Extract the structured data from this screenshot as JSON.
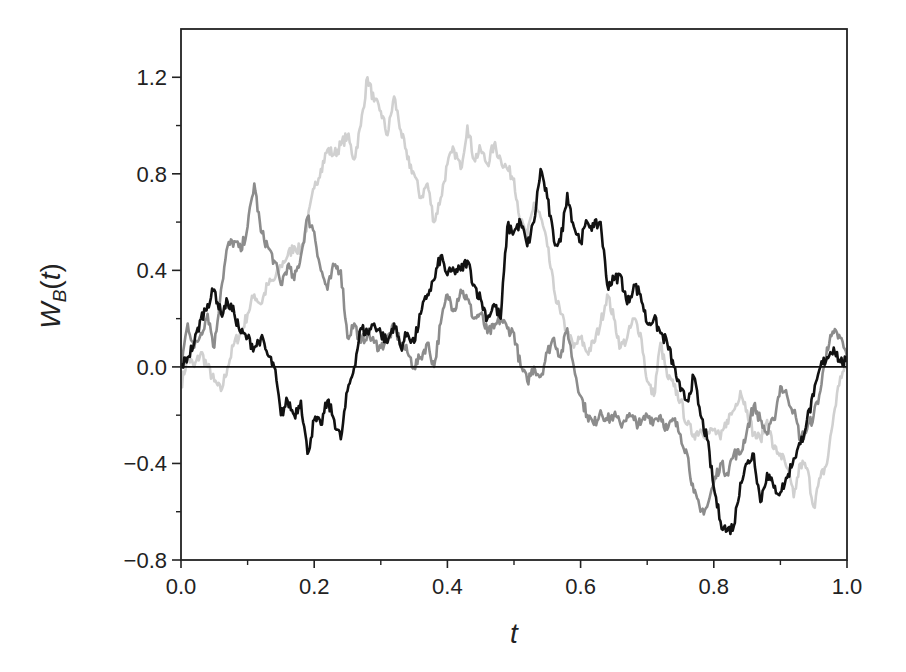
{
  "chart_data": {
    "type": "line",
    "title": "",
    "xlabel": "t",
    "ylabel": "W_B(t)",
    "ylabel_main": "W",
    "ylabel_sub": "B",
    "ylabel_arg": "(t)",
    "xlim": [
      0.0,
      1.0
    ],
    "ylim": [
      -0.8,
      1.4
    ],
    "grid": false,
    "legend": "none",
    "reference_line": {
      "y": 0.0,
      "color": "#111111"
    },
    "x_ticks": [
      "0.0",
      "0.2",
      "0.4",
      "0.6",
      "0.8",
      "1.0"
    ],
    "x_tick_values": [
      0.0,
      0.2,
      0.4,
      0.6,
      0.8,
      1.0
    ],
    "x_minor_ticks": [
      0.1,
      0.3,
      0.5,
      0.7,
      0.9
    ],
    "y_ticks": [
      "1.2",
      "0.8",
      "0.4",
      "0.0",
      "−0.4",
      "−0.8"
    ],
    "y_tick_values": [
      1.2,
      0.8,
      0.4,
      0.0,
      -0.4,
      -0.8
    ],
    "y_minor_ticks": [
      1.0,
      0.6,
      0.2,
      -0.2,
      -0.6
    ],
    "x": [
      0.0,
      0.01,
      0.02,
      0.03,
      0.04,
      0.05,
      0.06,
      0.07,
      0.08,
      0.09,
      0.1,
      0.11,
      0.12,
      0.13,
      0.14,
      0.15,
      0.16,
      0.17,
      0.18,
      0.19,
      0.2,
      0.21,
      0.22,
      0.23,
      0.24,
      0.25,
      0.26,
      0.27,
      0.28,
      0.29,
      0.3,
      0.31,
      0.32,
      0.33,
      0.34,
      0.35,
      0.36,
      0.37,
      0.38,
      0.39,
      0.4,
      0.41,
      0.42,
      0.43,
      0.44,
      0.45,
      0.46,
      0.47,
      0.48,
      0.49,
      0.5,
      0.51,
      0.52,
      0.53,
      0.54,
      0.55,
      0.56,
      0.57,
      0.58,
      0.59,
      0.6,
      0.61,
      0.62,
      0.63,
      0.64,
      0.65,
      0.66,
      0.67,
      0.68,
      0.69,
      0.7,
      0.71,
      0.72,
      0.73,
      0.74,
      0.75,
      0.76,
      0.77,
      0.78,
      0.79,
      0.8,
      0.81,
      0.82,
      0.83,
      0.84,
      0.85,
      0.86,
      0.87,
      0.88,
      0.89,
      0.9,
      0.91,
      0.92,
      0.93,
      0.94,
      0.95,
      0.96,
      0.97,
      0.98,
      0.99,
      1.0
    ],
    "series": [
      {
        "name": "bridge-light-gray",
        "color": "#d0d0d0",
        "values": [
          -0.08,
          0.04,
          0.0,
          0.06,
          0.0,
          -0.06,
          -0.1,
          0.0,
          0.1,
          0.14,
          0.22,
          0.3,
          0.26,
          0.34,
          0.36,
          0.42,
          0.46,
          0.5,
          0.48,
          0.6,
          0.74,
          0.82,
          0.9,
          0.88,
          0.92,
          0.96,
          0.86,
          1.0,
          1.2,
          1.1,
          1.06,
          0.96,
          1.12,
          0.98,
          0.86,
          0.8,
          0.7,
          0.76,
          0.6,
          0.7,
          0.84,
          0.9,
          0.82,
          1.0,
          0.86,
          0.9,
          0.84,
          0.92,
          0.86,
          0.82,
          0.78,
          0.6,
          0.54,
          0.68,
          0.62,
          0.5,
          0.32,
          0.22,
          0.14,
          0.08,
          0.12,
          0.06,
          0.1,
          0.18,
          0.3,
          0.2,
          0.08,
          0.12,
          0.2,
          0.14,
          -0.06,
          -0.12,
          0.1,
          -0.04,
          -0.08,
          -0.14,
          -0.24,
          -0.28,
          -0.26,
          -0.28,
          -0.26,
          -0.3,
          -0.22,
          -0.18,
          -0.1,
          -0.18,
          -0.28,
          -0.3,
          -0.22,
          -0.34,
          -0.36,
          -0.42,
          -0.54,
          -0.4,
          -0.42,
          -0.58,
          -0.46,
          -0.4,
          -0.2,
          -0.04,
          0.0
        ]
      },
      {
        "name": "bridge-medium-gray",
        "color": "#8c8c8c",
        "values": [
          0.0,
          0.18,
          0.08,
          0.14,
          0.22,
          0.08,
          0.32,
          0.5,
          0.52,
          0.48,
          0.58,
          0.76,
          0.56,
          0.5,
          0.44,
          0.34,
          0.42,
          0.36,
          0.46,
          0.62,
          0.56,
          0.4,
          0.32,
          0.42,
          0.4,
          0.12,
          0.18,
          0.1,
          0.14,
          0.1,
          0.08,
          0.12,
          0.16,
          0.1,
          0.06,
          0.0,
          0.04,
          0.1,
          0.0,
          0.18,
          0.3,
          0.24,
          0.32,
          0.28,
          0.2,
          0.22,
          0.14,
          0.16,
          0.2,
          0.16,
          0.14,
          0.0,
          -0.06,
          0.0,
          -0.04,
          0.06,
          0.12,
          0.04,
          0.16,
          0.0,
          -0.12,
          -0.2,
          -0.24,
          -0.18,
          -0.22,
          -0.2,
          -0.24,
          -0.2,
          -0.22,
          -0.24,
          -0.2,
          -0.22,
          -0.2,
          -0.26,
          -0.22,
          -0.28,
          -0.36,
          -0.52,
          -0.6,
          -0.58,
          -0.48,
          -0.4,
          -0.44,
          -0.36,
          -0.36,
          -0.26,
          -0.16,
          -0.22,
          -0.28,
          -0.22,
          -0.08,
          -0.12,
          -0.18,
          -0.3,
          -0.26,
          -0.2,
          -0.1,
          0.08,
          0.14,
          0.12,
          0.04
        ]
      },
      {
        "name": "bridge-black",
        "color": "#111111",
        "values": [
          0.0,
          0.04,
          0.1,
          0.2,
          0.26,
          0.32,
          0.22,
          0.27,
          0.22,
          0.14,
          0.12,
          0.08,
          0.12,
          0.05,
          0.0,
          -0.2,
          -0.14,
          -0.2,
          -0.14,
          -0.36,
          -0.22,
          -0.24,
          -0.14,
          -0.22,
          -0.3,
          -0.1,
          0.0,
          0.16,
          0.14,
          0.18,
          0.14,
          0.1,
          0.18,
          0.08,
          0.14,
          0.1,
          0.22,
          0.3,
          0.36,
          0.46,
          0.38,
          0.4,
          0.4,
          0.44,
          0.34,
          0.28,
          0.2,
          0.26,
          0.2,
          0.58,
          0.56,
          0.6,
          0.5,
          0.6,
          0.82,
          0.7,
          0.52,
          0.52,
          0.72,
          0.58,
          0.52,
          0.6,
          0.58,
          0.6,
          0.34,
          0.36,
          0.38,
          0.26,
          0.34,
          0.3,
          0.18,
          0.2,
          0.14,
          0.1,
          0.0,
          -0.1,
          -0.14,
          -0.04,
          -0.2,
          -0.3,
          -0.5,
          -0.64,
          -0.68,
          -0.66,
          -0.48,
          -0.4,
          -0.36,
          -0.56,
          -0.44,
          -0.5,
          -0.52,
          -0.46,
          -0.38,
          -0.32,
          -0.22,
          -0.12,
          0.0,
          0.04,
          0.08,
          0.02,
          0.02
        ]
      }
    ]
  }
}
